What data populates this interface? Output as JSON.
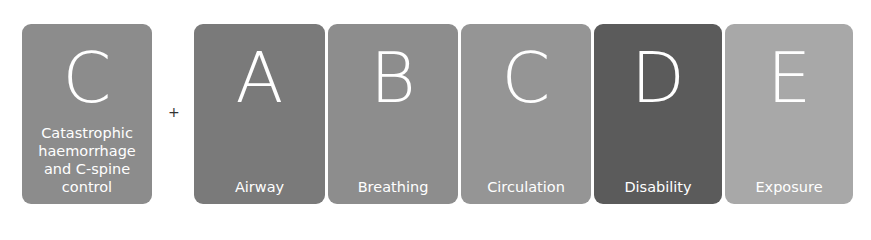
{
  "diagram": {
    "prefix_card": {
      "letter": "C",
      "label": "Catastrophic haemorrhage and C-spine control",
      "label_lines": [
        "Catastrophic",
        "haemorrhage",
        "and C-spine",
        "control"
      ],
      "color": "#8c8c8c"
    },
    "operator": "+",
    "cards": [
      {
        "letter": "A",
        "label": "Airway",
        "color": "#7a7a7a"
      },
      {
        "letter": "B",
        "label": "Breathing",
        "color": "#8d8d8d"
      },
      {
        "letter": "C",
        "label": "Circulation",
        "color": "#959595"
      },
      {
        "letter": "D",
        "label": "Disability",
        "color": "#5b5b5b"
      },
      {
        "letter": "E",
        "label": "Exposure",
        "color": "#a8a8a8"
      }
    ]
  }
}
